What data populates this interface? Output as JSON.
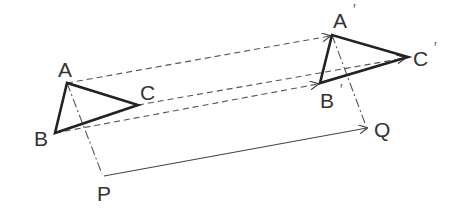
{
  "colors": {
    "triangle": "#222222",
    "guide": "#555555",
    "label": "#333333",
    "background": "#ffffff"
  },
  "labels": {
    "A": "A",
    "B": "B",
    "C": "C",
    "A_prime": "A",
    "B_prime": "B",
    "C_prime": "C",
    "prime_mark": "′",
    "P": "P",
    "Q": "Q"
  },
  "points": {
    "A": [
      67,
      83
    ],
    "B": [
      55,
      133
    ],
    "C": [
      138,
      105
    ],
    "A_prime": [
      332,
      35
    ],
    "B_prime": [
      320,
      83
    ],
    "C_prime": [
      408,
      57
    ],
    "P": [
      104,
      176
    ],
    "Q": [
      369,
      128
    ]
  },
  "elements": {
    "original_triangle": "ABC (bold)",
    "image_triangle": "A′B′C′ (bold)",
    "translation_arrows": [
      "A→A′ (dashed)",
      "B→B′ (dashed)",
      "C→C′ (dashed)"
    ],
    "vector": "P→Q (solid arrow)",
    "construction_lines": [
      "A–P (dash-dot)",
      "A′–Q (dash-dot)"
    ]
  }
}
